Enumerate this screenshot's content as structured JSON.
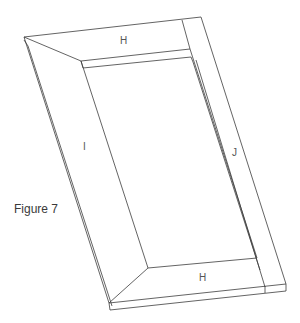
{
  "figure": {
    "caption": "Figure 7",
    "labels": {
      "top_rail": "H",
      "bottom_rail": "H",
      "left_stile": "I",
      "right_stile": "J"
    },
    "colors": {
      "line": "#3c3c3c",
      "label": "#555555",
      "background": "#ffffff"
    }
  }
}
